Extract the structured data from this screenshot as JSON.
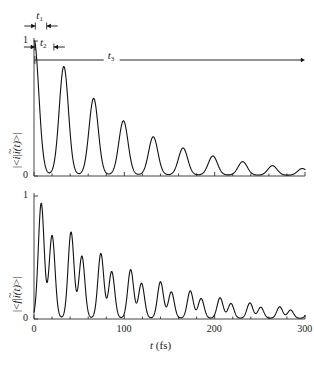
{
  "figure": {
    "width": 314,
    "height": 366,
    "background": "#ffffff",
    "line_color": "#111111",
    "axis_color": "#444444"
  },
  "axes": {
    "x": {
      "label_italic": "t",
      "label_unit": "(fs)",
      "min": 0,
      "max": 300,
      "ticks": [
        0,
        100,
        200,
        300
      ],
      "tick_labels": [
        "0",
        "100",
        "200",
        "300"
      ],
      "minor_tick_step": 20
    },
    "y_top": {
      "min": 0,
      "max": 1,
      "ticks": [
        0,
        1
      ],
      "tick_labels": [
        "0",
        "1"
      ],
      "label_parts": {
        "open": "|<",
        "bra": "i",
        "mid": "|",
        "ket_base": "i",
        "ket_tilde": "~",
        "arg": "(t)",
        "close": ">|"
      }
    },
    "y_bottom": {
      "min": 0,
      "max": 1,
      "ticks": [
        0,
        1
      ],
      "tick_labels": [
        "0",
        "1"
      ],
      "label_parts": {
        "open": "|<",
        "bra": "f",
        "mid": "|",
        "ket_base": "i",
        "ket_tilde": "~",
        "arg": "(t)",
        "close": ">|"
      }
    }
  },
  "annotations": [
    {
      "name": "t1",
      "base": "t",
      "sub": "1",
      "span_fs": [
        1.5,
        14.0
      ],
      "style": "double-arrow-inward",
      "label_x_fs": 7.0
    },
    {
      "name": "t2",
      "base": "t",
      "sub": "2",
      "span_fs": [
        1.0,
        22.0
      ],
      "style": "double-arrow-inward",
      "label_x_fs": 11.0
    },
    {
      "name": "t3",
      "base": "t",
      "sub": "3",
      "span_fs": [
        1.0,
        300.0
      ],
      "style": "arrow-right",
      "label_x_fs": 86.0
    }
  ],
  "chart_data": [
    {
      "id": "top-panel",
      "type": "line",
      "title": "",
      "xlabel": "t (fs)",
      "ylabel": "|<i|i~(t)>|",
      "xlim": [
        0,
        300
      ],
      "ylim": [
        0,
        1
      ],
      "grid": false,
      "legend": null,
      "description": "Autocorrelation magnitude: initial value 1 at t=0, rapid decay, then a train of damped recurrence peaks spaced about 33 fs apart that nearly reach zero between peaks.",
      "model": {
        "kind": "recurrence-train",
        "initial_value": 1.0,
        "initial_decay_fs": 7.5,
        "recurrence_period_fs": 33.0,
        "recurrence_width_fs": 7.2,
        "recurrence_decay_fs": 95.0,
        "recurrence_first_amp": 0.8,
        "baseline": 0.012
      },
      "peaks": [
        {
          "t": 0,
          "value": 1.0
        },
        {
          "t": 33,
          "value": 0.8
        },
        {
          "t": 66,
          "value": 0.6
        },
        {
          "t": 99,
          "value": 0.455
        },
        {
          "t": 132,
          "value": 0.335
        },
        {
          "t": 165,
          "value": 0.245
        },
        {
          "t": 198,
          "value": 0.185
        },
        {
          "t": 231,
          "value": 0.135
        },
        {
          "t": 264,
          "value": 0.105
        },
        {
          "t": 297,
          "value": 0.075
        }
      ]
    },
    {
      "id": "bottom-panel",
      "type": "line",
      "title": "",
      "xlabel": "t (fs)",
      "ylabel": "|<f|i~(t)>|",
      "xlim": [
        0,
        300
      ],
      "ylim": [
        0,
        1
      ],
      "grid": false,
      "legend": null,
      "description": "Cross-correlation magnitude: rises from 0 at t=0 to a first maximum near 0.93, then a train of doublet recurrences (two sub-peaks per period, the first taller) separated by deep nulls every 33 fs, decaying slowly.",
      "model": {
        "kind": "doublet-recurrence-train",
        "recurrence_period_fs": 33.0,
        "sub_peak_offsets_fs": [
          8.0,
          20.0
        ],
        "sub_peak_ratio": [
          1.0,
          0.72
        ],
        "sub_peak_width_fs": 4.6,
        "envelope_decay_fs": 115.0,
        "first_amp": 0.93,
        "baseline": 0.01
      },
      "peaks": [
        {
          "t": 8,
          "value": 0.93
        },
        {
          "t": 20,
          "value": 0.67
        },
        {
          "t": 41,
          "value": 0.7
        },
        {
          "t": 53,
          "value": 0.5
        },
        {
          "t": 74,
          "value": 0.54
        },
        {
          "t": 86,
          "value": 0.39
        },
        {
          "t": 107,
          "value": 0.42
        },
        {
          "t": 119,
          "value": 0.3
        },
        {
          "t": 140,
          "value": 0.33
        },
        {
          "t": 152,
          "value": 0.24
        },
        {
          "t": 173,
          "value": 0.26
        },
        {
          "t": 185,
          "value": 0.19
        },
        {
          "t": 206,
          "value": 0.2
        },
        {
          "t": 218,
          "value": 0.15
        },
        {
          "t": 239,
          "value": 0.16
        },
        {
          "t": 251,
          "value": 0.12
        },
        {
          "t": 272,
          "value": 0.13
        },
        {
          "t": 284,
          "value": 0.1
        }
      ]
    }
  ]
}
